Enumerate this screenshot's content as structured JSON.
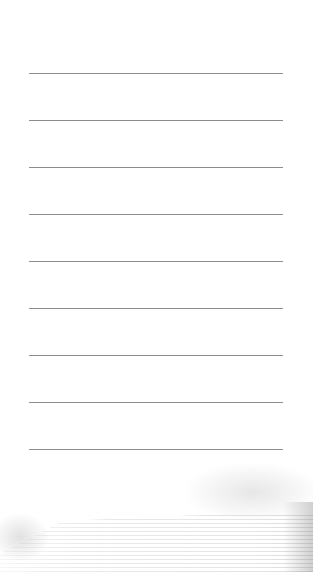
{
  "page": {
    "type": "lined-notepaper",
    "background_color": "#ffffff",
    "rule_color": "#8c8c8c",
    "rules": [
      {
        "y": 73
      },
      {
        "y": 120
      },
      {
        "y": 167
      },
      {
        "y": 214
      },
      {
        "y": 261
      },
      {
        "y": 308
      },
      {
        "y": 355
      },
      {
        "y": 402
      },
      {
        "y": 449
      }
    ],
    "watermark": {
      "subject": "faded-staircase-photo",
      "position": "bottom"
    }
  }
}
